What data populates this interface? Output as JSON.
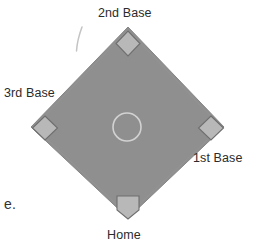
{
  "figure": {
    "background_color": "#ffffff",
    "width": 253,
    "height": 246
  },
  "colors": {
    "infield_fill": "#8f8f8f",
    "infield_stroke": "#8a8a8a",
    "base_fill": "#b8b8b8",
    "base_stroke": "#6e6e6e",
    "mound_stroke": "#cfcfcf",
    "label_text": "#2b2b2b",
    "pencil_mark": "#bfbfbf"
  },
  "labels": {
    "second_base": "2nd Base",
    "third_base": "3rd Base",
    "first_base": "1st Base",
    "home": "Home",
    "text_fragment": "e."
  },
  "diagram": {
    "type": "baseball-diamond",
    "infield": {
      "shape": "diamond",
      "apex_top": [
        128,
        27
      ],
      "apex_left": [
        31,
        127
      ],
      "apex_right": [
        224,
        127
      ],
      "apex_bottom": [
        128,
        218
      ]
    },
    "bases": [
      {
        "name": "second-base",
        "shape": "square-rotated",
        "center": [
          128,
          43
        ],
        "size": 17
      },
      {
        "name": "third-base",
        "shape": "square-rotated",
        "center": [
          45,
          128
        ],
        "size": 17
      },
      {
        "name": "first-base",
        "shape": "square-rotated",
        "center": [
          211,
          128
        ],
        "size": 17
      },
      {
        "name": "home-plate",
        "shape": "pentagon-down",
        "center": [
          128,
          207
        ],
        "size": 18
      }
    ],
    "pitchers_mound": {
      "shape": "circle-outline",
      "center": [
        127,
        127
      ],
      "radius": 14
    },
    "pencil_mark": {
      "shape": "stroke",
      "from": [
        81,
        28
      ],
      "to": [
        77,
        50
      ]
    }
  }
}
